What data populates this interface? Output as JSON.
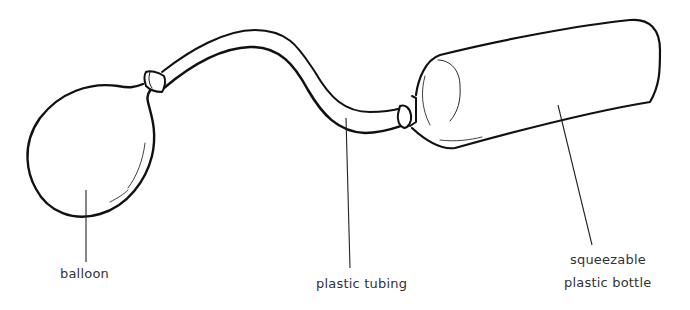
{
  "diagram": {
    "type": "apparatus-illustration",
    "parts": [
      {
        "id": "balloon",
        "label": "balloon"
      },
      {
        "id": "tubing",
        "label": "plastic tubing"
      },
      {
        "id": "bottle",
        "label_line1": "squeezable",
        "label_line2": "plastic bottle"
      }
    ],
    "colors": {
      "stroke": "#111111",
      "leader": "#222222",
      "text": "#333333",
      "background": "#ffffff"
    }
  }
}
